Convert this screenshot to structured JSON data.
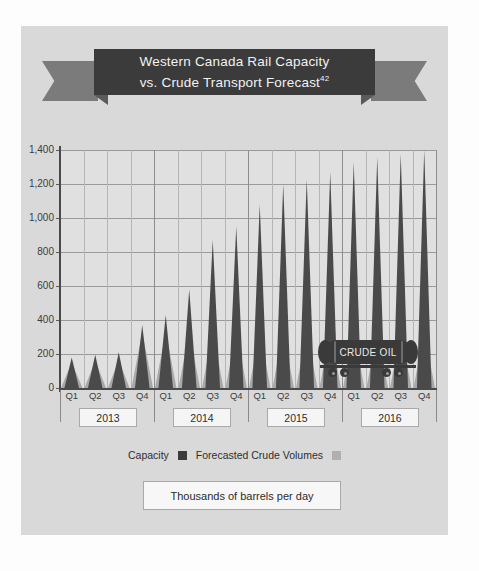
{
  "title": {
    "line1": "Western Canada Rail Capacity",
    "line2": "vs. Crude Transport Forecast",
    "footnote": "42"
  },
  "caption": {
    "text": "Thousands of barrels per day"
  },
  "legend": {
    "series1_label": "Capacity",
    "series2_label": "Forecasted Crude Volumes",
    "series1_color": "#3b3b3b",
    "series2_color": "#b0b0b0"
  },
  "overlay": {
    "tank_car_label": "CRUDE OIL"
  },
  "years": [
    "2013",
    "2014",
    "2015",
    "2016"
  ],
  "chart_data": {
    "type": "bar",
    "title": "Western Canada Rail Capacity vs. Crude Transport Forecast",
    "xlabel": "",
    "ylabel": "Thousands of barrels per day",
    "ylim": [
      0,
      1400
    ],
    "yticks": [
      "0",
      "200",
      "400",
      "600",
      "800",
      "1,000",
      "1,200",
      "1,400"
    ],
    "ytick_values": [
      0,
      200,
      400,
      600,
      800,
      1000,
      1200,
      1400
    ],
    "grid": true,
    "legend_position": "bottom",
    "categories": [
      "Q1 2013",
      "Q2 2013",
      "Q3 2013",
      "Q4 2013",
      "Q1 2014",
      "Q2 2014",
      "Q3 2014",
      "Q4 2014",
      "Q1 2015",
      "Q2 2015",
      "Q3 2015",
      "Q4 2015",
      "Q1 2016",
      "Q2 2016",
      "Q3 2016",
      "Q4 2016"
    ],
    "quarter_labels": [
      "Q1",
      "Q2",
      "Q3",
      "Q4",
      "Q1",
      "Q2",
      "Q3",
      "Q4",
      "Q1",
      "Q2",
      "Q3",
      "Q4",
      "Q1",
      "Q2",
      "Q3",
      "Q4"
    ],
    "series": [
      {
        "name": "Capacity",
        "color": "#a8a8a8",
        "values": [
          150,
          160,
          165,
          330,
          330,
          330,
          330,
          330,
          330,
          330,
          330,
          330,
          330,
          330,
          330,
          330
        ]
      },
      {
        "name": "Forecasted Crude Volumes",
        "color": "#4a4a4a",
        "values": [
          180,
          195,
          210,
          370,
          430,
          580,
          870,
          950,
          1080,
          1200,
          1230,
          1270,
          1330,
          1360,
          1380,
          1400
        ]
      }
    ]
  }
}
